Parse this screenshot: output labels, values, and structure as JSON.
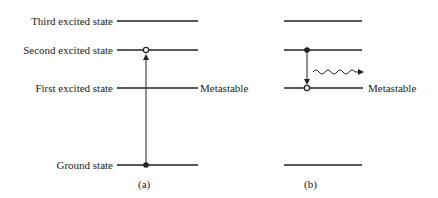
{
  "diagram": {
    "panel_a": {
      "levels": [
        {
          "label": "Third excited state",
          "y": 21
        },
        {
          "label": "Second excited state",
          "y": 50
        },
        {
          "label": "First excited state",
          "y": 88,
          "side_label": "Metastable"
        },
        {
          "label": "Ground state",
          "y": 165
        }
      ],
      "caption": "(a)"
    },
    "panel_b": {
      "metastable_label": "Metastable",
      "caption": "(b)"
    }
  }
}
